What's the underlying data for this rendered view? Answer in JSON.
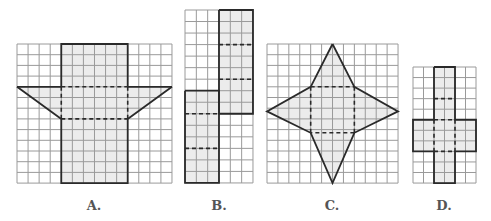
{
  "figures": [
    {
      "id": "A",
      "label": "A.",
      "label_x": 94,
      "grid": {
        "x": 17,
        "y": 44,
        "cols": 14,
        "rows": 13,
        "cw": 11.07,
        "ch": 10.7
      },
      "fill": [
        [
          4,
          0
        ],
        [
          10,
          0
        ],
        [
          10,
          4
        ],
        [
          14,
          4
        ],
        [
          10,
          7
        ],
        [
          10,
          13
        ],
        [
          4,
          13
        ],
        [
          4,
          7
        ],
        [
          0,
          4
        ],
        [
          4,
          4
        ]
      ],
      "solid": [
        [
          [
            4,
            4
          ],
          [
            4,
            0
          ],
          [
            10,
            0
          ],
          [
            10,
            4
          ]
        ],
        [
          [
            0,
            4
          ],
          [
            4,
            4
          ]
        ],
        [
          [
            10,
            4
          ],
          [
            14,
            4
          ]
        ],
        [
          [
            0,
            4
          ],
          [
            4,
            7
          ],
          [
            4,
            13
          ],
          [
            10,
            13
          ],
          [
            10,
            7
          ],
          [
            14,
            4
          ]
        ]
      ],
      "dashed": [
        [
          [
            4,
            4
          ],
          [
            10,
            4
          ]
        ],
        [
          [
            4,
            7
          ],
          [
            10,
            7
          ]
        ],
        [
          [
            4,
            4
          ],
          [
            4,
            7
          ]
        ],
        [
          [
            10,
            4
          ],
          [
            10,
            7
          ]
        ]
      ]
    },
    {
      "id": "B",
      "label": "B.",
      "label_x": 219,
      "grid": {
        "x": 185,
        "y": 10,
        "cols": 6,
        "rows": 15,
        "cw": 11.33,
        "ch": 11.53
      },
      "fill": [
        [
          3,
          0
        ],
        [
          6,
          0
        ],
        [
          6,
          9
        ],
        [
          3,
          9
        ],
        [
          3,
          15
        ],
        [
          0,
          15
        ],
        [
          0,
          7
        ],
        [
          3,
          7
        ]
      ],
      "solid": [
        [
          [
            3,
            0
          ],
          [
            6,
            0
          ],
          [
            6,
            9
          ],
          [
            3,
            9
          ],
          [
            3,
            0
          ]
        ],
        [
          [
            0,
            7
          ],
          [
            3,
            7
          ],
          [
            3,
            15
          ],
          [
            0,
            15
          ],
          [
            0,
            7
          ]
        ]
      ],
      "dashed": [
        [
          [
            3,
            3
          ],
          [
            6,
            3
          ]
        ],
        [
          [
            3,
            6
          ],
          [
            6,
            6
          ]
        ],
        [
          [
            0,
            9
          ],
          [
            3,
            9
          ]
        ],
        [
          [
            0,
            12
          ],
          [
            3,
            12
          ]
        ]
      ]
    },
    {
      "id": "C",
      "label": "C.",
      "label_x": 332,
      "grid": {
        "x": 267,
        "y": 44,
        "cols": 12,
        "rows": 13,
        "cw": 10.92,
        "ch": 10.7
      },
      "fill": [
        [
          6,
          0
        ],
        [
          8,
          4
        ],
        [
          12,
          6.3
        ],
        [
          8,
          8.3
        ],
        [
          6,
          13
        ],
        [
          4,
          8.3
        ],
        [
          0,
          6.3
        ],
        [
          4,
          4
        ]
      ],
      "solid": [
        [
          [
            6,
            0
          ],
          [
            8,
            4
          ],
          [
            12,
            6.3
          ],
          [
            8,
            8.3
          ],
          [
            6,
            13
          ],
          [
            4,
            8.3
          ],
          [
            0,
            6.3
          ],
          [
            4,
            4
          ],
          [
            6,
            0
          ]
        ]
      ],
      "dashed": [
        [
          [
            4,
            4
          ],
          [
            8,
            4
          ]
        ],
        [
          [
            8,
            4
          ],
          [
            8,
            8.3
          ]
        ],
        [
          [
            8,
            8.3
          ],
          [
            4,
            8.3
          ]
        ],
        [
          [
            4,
            8.3
          ],
          [
            4,
            4
          ]
        ]
      ]
    },
    {
      "id": "D",
      "label": "D.",
      "label_x": 444,
      "grid": {
        "x": 413,
        "y": 67,
        "cols": 6,
        "rows": 11,
        "cw": 10.5,
        "ch": 10.55
      },
      "fill": [
        [
          2,
          0
        ],
        [
          4,
          0
        ],
        [
          4,
          5
        ],
        [
          6,
          5
        ],
        [
          6,
          8
        ],
        [
          4,
          8
        ],
        [
          4,
          11
        ],
        [
          2,
          11
        ],
        [
          2,
          8
        ],
        [
          0,
          8
        ],
        [
          0,
          5
        ],
        [
          2,
          5
        ]
      ],
      "solid": [
        [
          [
            2,
            0
          ],
          [
            4,
            0
          ],
          [
            4,
            5
          ],
          [
            6,
            5
          ],
          [
            6,
            8
          ],
          [
            4,
            8
          ],
          [
            4,
            11
          ],
          [
            2,
            11
          ],
          [
            2,
            8
          ],
          [
            0,
            8
          ],
          [
            0,
            5
          ],
          [
            2,
            5
          ],
          [
            2,
            0
          ]
        ]
      ],
      "dashed": [
        [
          [
            2,
            3
          ],
          [
            4,
            3
          ]
        ],
        [
          [
            2,
            5
          ],
          [
            4,
            5
          ]
        ],
        [
          [
            2,
            8
          ],
          [
            4,
            8
          ]
        ],
        [
          [
            2,
            5
          ],
          [
            2,
            8
          ]
        ],
        [
          [
            4,
            5
          ],
          [
            4,
            8
          ]
        ]
      ]
    }
  ],
  "colors": {
    "grid": "#9a9a9a",
    "outline": "#2a2a2a",
    "fill": "#ececec",
    "label": "#555555"
  }
}
